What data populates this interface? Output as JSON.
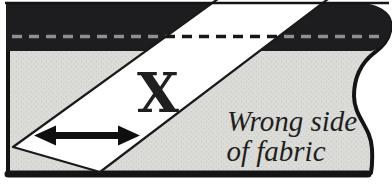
{
  "diagram": {
    "kind": "sewing-instruction-figure",
    "strip_label": "X",
    "fabric_label": {
      "line1": "Wrong side",
      "line2": "of fabric"
    },
    "icons": {
      "grainline_arrow": "double-headed-arrow"
    },
    "colors": {
      "background": "#ffffff",
      "fabric": "#dbdbd7",
      "fabric_speckle": "#c8c8c4",
      "fold_band": "#1d1d1f",
      "outline": "#141414",
      "strip_fill": "#ffffff",
      "strip_outline": "#1a1a1a",
      "stitch_dash_on_band": "#8f8f8f",
      "stitch_dash_on_strip": "#161616",
      "arrow": "#0f0f0f",
      "label_color": "#1f1f1f"
    }
  }
}
